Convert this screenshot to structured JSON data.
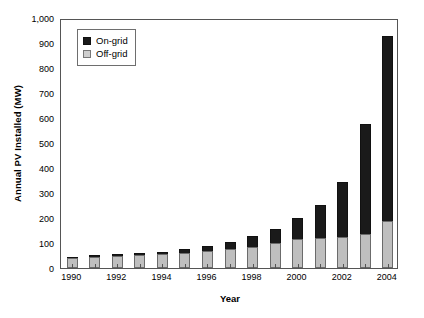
{
  "chart_data": {
    "type": "bar",
    "stacked": true,
    "title": "",
    "xlabel": "Year",
    "ylabel": "Annual PV Installed (MW)",
    "categories": [
      1990,
      1991,
      1992,
      1993,
      1994,
      1995,
      1996,
      1997,
      1998,
      1999,
      2000,
      2001,
      2002,
      2003,
      2004
    ],
    "x_tick_labels": [
      "1990",
      "",
      "1992",
      "",
      "1994",
      "",
      "1996",
      "",
      "1998",
      "",
      "2000",
      "",
      "2002",
      "",
      "2004"
    ],
    "y_tick_labels": [
      "0",
      "100",
      "200",
      "300",
      "400",
      "500",
      "600",
      "700",
      "800",
      "900",
      "1,000"
    ],
    "y_tick_values": [
      0,
      100,
      200,
      300,
      400,
      500,
      600,
      700,
      800,
      900,
      1000
    ],
    "ylim": [
      0,
      1000
    ],
    "grid": false,
    "legend_position": "top-left inside plot",
    "series": [
      {
        "name": "Off-grid",
        "color": "#bfbfbf",
        "values": [
          42,
          46,
          50,
          54,
          58,
          62,
          70,
          76,
          84,
          100,
          118,
          122,
          125,
          135,
          190
        ]
      },
      {
        "name": "On-grid",
        "color": "#1a1a1a",
        "values": [
          4,
          5,
          5,
          6,
          8,
          13,
          18,
          28,
          44,
          58,
          82,
          130,
          220,
          440,
          740
        ]
      }
    ],
    "totals": [
      46,
      51,
      55,
      60,
      66,
      75,
      88,
      104,
      128,
      158,
      200,
      252,
      345,
      575,
      930
    ]
  },
  "legend": {
    "items": [
      {
        "label": "On-grid"
      },
      {
        "label": "Off-grid"
      }
    ]
  }
}
